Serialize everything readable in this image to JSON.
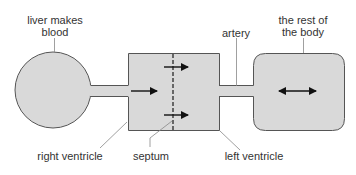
{
  "diagram": {
    "title": "",
    "colors": {
      "fill": "#d9d9d9",
      "stroke": "#555555",
      "arrow": "#111111",
      "septum": "#666666",
      "leader": "#888888",
      "text": "#333333"
    },
    "labels": {
      "liver": [
        "liver makes",
        "blood"
      ],
      "artery": "artery",
      "rest_of_body": [
        "the rest of",
        "the body"
      ],
      "right_ventricle": "right ventricle",
      "septum": "septum",
      "left_ventricle": "left ventricle"
    },
    "nodes": [
      {
        "id": "liver",
        "shape": "circle"
      },
      {
        "id": "heart",
        "shape": "rectangle",
        "divided_by": "septum"
      },
      {
        "id": "rest-of-body",
        "shape": "rounded-rectangle"
      }
    ],
    "connections": [
      {
        "from": "liver",
        "to": "heart",
        "type": "tube"
      },
      {
        "from": "heart",
        "to": "rest-of-body",
        "type": "artery"
      }
    ],
    "arrows": [
      {
        "location": "right ventricle",
        "direction": "right"
      },
      {
        "location": "across septum upper",
        "direction": "right"
      },
      {
        "location": "across septum lower",
        "direction": "right"
      },
      {
        "location": "rest of the body",
        "direction": "both"
      }
    ]
  }
}
